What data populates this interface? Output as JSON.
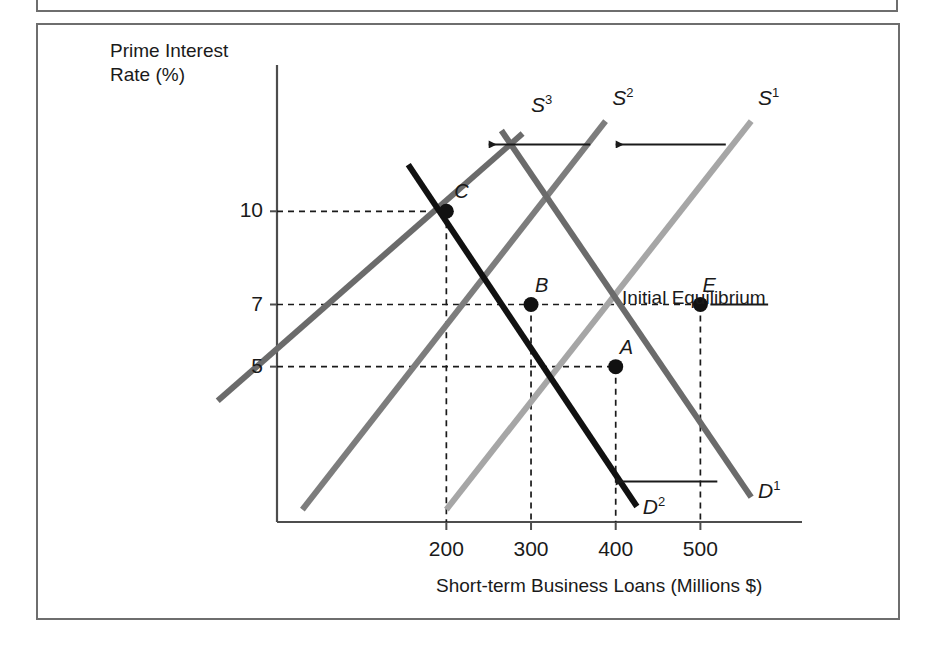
{
  "figure": {
    "y_axis_title_line1": "Prime Interest",
    "y_axis_title_line2": "Rate (%)",
    "x_axis_title": "Short-term Business Loans (Millions $)",
    "annotation": "Initial Equilibrium"
  },
  "colors": {
    "frame": "#6e6e6e",
    "axis": "#4d4d4d",
    "supply_1": "#a6a6a6",
    "supply_2": "#7d7d7d",
    "supply_3": "#6b6b6b",
    "demand_1": "#6b6b6b",
    "demand_2": "#111111",
    "point": "#111111",
    "guide": "#1a1a1a",
    "arrow": "#1a1a1a",
    "text": "#1a1a1a"
  },
  "chart_data": {
    "type": "line",
    "title": "",
    "xlabel": "Short-term Business Loans (Millions $)",
    "ylabel": "Prime Interest Rate (%)",
    "xlim": [
      0,
      620
    ],
    "ylim": [
      0,
      14
    ],
    "grid": false,
    "x_ticks": [
      200,
      300,
      400,
      500
    ],
    "x_tick_labels": [
      "200",
      "300",
      "400",
      "500"
    ],
    "y_ticks": [
      5,
      7,
      10
    ],
    "y_tick_labels": [
      "5",
      "7",
      "10"
    ],
    "legend": "inline-curve-labels",
    "series": [
      {
        "name": "S1",
        "label": "S",
        "superscript": "1",
        "kind": "supply",
        "color": "#a6a6a6",
        "x": [
          200,
          560
        ],
        "y": [
          0.4,
          12.9
        ],
        "label_pos": [
          568,
          13.6
        ]
      },
      {
        "name": "S2",
        "label": "S",
        "superscript": "2",
        "kind": "supply",
        "color": "#7d7d7d",
        "x": [
          30,
          388
        ],
        "y": [
          0.4,
          12.9
        ],
        "label_pos": [
          396,
          13.6
        ]
      },
      {
        "name": "S3",
        "label": "S",
        "superscript": "3",
        "kind": "supply",
        "color": "#6b6b6b",
        "x": [
          -70,
          290
        ],
        "y": [
          3.9,
          12.5
        ],
        "label_pos": [
          300,
          13.4
        ]
      },
      {
        "name": "D1",
        "label": "D",
        "superscript": "1",
        "kind": "demand",
        "color": "#6b6b6b",
        "x": [
          265,
          560
        ],
        "y": [
          12.6,
          0.8
        ],
        "label_pos": [
          568,
          0.95
        ]
      },
      {
        "name": "D2",
        "label": "D",
        "superscript": "2",
        "kind": "demand",
        "color": "#111111",
        "x": [
          155,
          425
        ],
        "y": [
          11.5,
          0.5
        ],
        "label_pos": [
          432,
          0.45
        ]
      }
    ],
    "points": [
      {
        "name": "C",
        "x": 200,
        "y": 10,
        "label_dx": 8,
        "label_dy": -18
      },
      {
        "name": "B",
        "x": 300,
        "y": 7,
        "label_dx": 4,
        "label_dy": -18
      },
      {
        "name": "A",
        "x": 400,
        "y": 5,
        "label_dx": 4,
        "label_dy": -18
      },
      {
        "name": "E",
        "x": 500,
        "y": 7,
        "label_dx": 2,
        "label_dy": -18
      }
    ],
    "guide_lines": [
      {
        "from": "y-axis",
        "to_point": "C",
        "type": "dashed-horizontal",
        "value": 10
      },
      {
        "from": "y-axis",
        "to_point": "B",
        "type": "dashed-horizontal",
        "value": 7
      },
      {
        "from": "y-axis",
        "to_point": "A",
        "type": "dashed-horizontal",
        "value": 5
      },
      {
        "from": "C",
        "to": "x-axis",
        "type": "dashed-vertical",
        "value": 200
      },
      {
        "from": "B",
        "to": "x-axis",
        "type": "dashed-vertical",
        "value": 300
      },
      {
        "from": "A",
        "to": "x-axis",
        "type": "dashed-vertical",
        "value": 400
      },
      {
        "from": "E",
        "to": "x-axis",
        "type": "dashed-vertical",
        "value": 500
      }
    ],
    "shift_arrows": [
      {
        "name": "supply-shift-1-to-2",
        "direction": "left",
        "from_x": 530,
        "to_x": 400,
        "y": 12.15
      },
      {
        "name": "supply-shift-2-to-3",
        "direction": "left",
        "from_x": 370,
        "to_x": 250,
        "y": 12.15
      },
      {
        "name": "demand-shift-1-to-2",
        "direction": "left",
        "from_x": 520,
        "to_x": 400,
        "y": 1.3
      }
    ],
    "annotations": [
      {
        "name": "initial-equilibrium",
        "text": "Initial Equilibrium",
        "attach_point": "E",
        "leader_to_x": 580,
        "leader_y": 7
      }
    ]
  }
}
